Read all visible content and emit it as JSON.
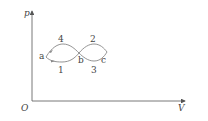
{
  "diagram": {
    "axes": {
      "y_label": "p",
      "x_label": "V",
      "origin_label": "O"
    },
    "points": {
      "a": "a",
      "b": "b",
      "c": "c"
    },
    "processes": {
      "p1": "1",
      "p2": "2",
      "p3": "3",
      "p4": "4"
    },
    "colors": {
      "axis": "#555555",
      "curve": "#777777",
      "text": "#444444"
    }
  }
}
